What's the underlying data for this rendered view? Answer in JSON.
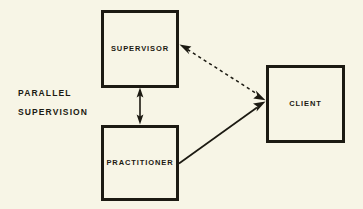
{
  "diagram": {
    "caption": {
      "line1": "PARALLEL",
      "line2": "SUPERVISION"
    },
    "nodes": [
      {
        "id": "supervisor",
        "label": "SUPERVISOR"
      },
      {
        "id": "practitioner",
        "label": "PRACTITIONER"
      },
      {
        "id": "client",
        "label": "CLIENT"
      }
    ],
    "edges": [
      {
        "id": "supervisor-practitioner",
        "from": "supervisor",
        "to": "practitioner",
        "style": "solid",
        "arrowheads": "both",
        "orientation": "vertical"
      },
      {
        "id": "supervisor-client",
        "from": "supervisor",
        "to": "client",
        "style": "dashed",
        "arrowheads": "both",
        "orientation": "diagonal"
      },
      {
        "id": "practitioner-client",
        "from": "practitioner",
        "to": "client",
        "style": "solid",
        "arrowheads": "single",
        "orientation": "diagonal"
      }
    ],
    "colors": {
      "background": "#f7f5e6",
      "ink": "#1c1a12"
    }
  }
}
